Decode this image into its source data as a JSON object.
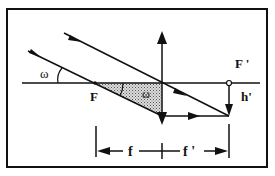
{
  "diagram": {
    "colors": {
      "line": "#111111",
      "background": "#ffffff",
      "hatch": "#9a9a9a"
    },
    "labels": {
      "angle_left": "ω",
      "angle_shaded": "ω",
      "focus_object": "F",
      "focus_image": "F '",
      "image_height": "h'",
      "focal_length_object": "f",
      "focal_length_image": "f '"
    },
    "elements": {
      "optical_axis": "horizontal line",
      "lens": "converging lens (double arrow vertical)",
      "ray_through_focus": "ray through F, exits parallel to axis",
      "ray_through_center": "ray through lens center, undeviated",
      "shaded_triangle": "triangle F – lens center – lens intersection, angle ω"
    }
  }
}
